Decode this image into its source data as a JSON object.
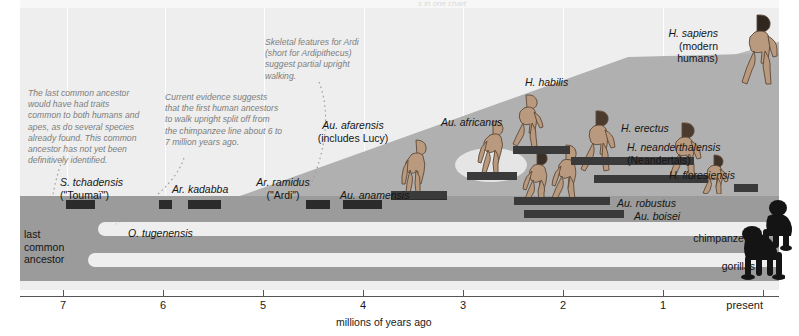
{
  "figure": {
    "title_cutoff": "s in one chart",
    "axis": {
      "title": "millions of years ago",
      "ticks": [
        {
          "label": "7",
          "value": 7,
          "x": 63
        },
        {
          "label": "6",
          "value": 6,
          "x": 163
        },
        {
          "label": "5",
          "value": 5,
          "x": 263
        },
        {
          "label": "4",
          "value": 4,
          "x": 363
        },
        {
          "label": "3",
          "value": 3,
          "x": 463
        },
        {
          "label": "2",
          "value": 2,
          "x": 563
        },
        {
          "label": "1",
          "value": 1,
          "x": 663
        },
        {
          "label": "present",
          "value": 0,
          "x": 763
        }
      ]
    },
    "root_label": "last\ncommon\nancestor",
    "notes": [
      {
        "id": "note-last-common-ancestor",
        "text": "The last common ancestor\nwould have had traits\ncommon to both humans and\napes, as do several species\nalready found. This common\nancestor has not yet been\ndefinitively identified.",
        "x": 28,
        "y": 88
      },
      {
        "id": "note-split-timing",
        "text": "Current evidence suggests\nthat the first human ancestors\nto walk upright split off from\nthe chimpanzee line about 6 to\n7 million years ago.",
        "x": 165,
        "y": 92
      },
      {
        "id": "note-ardi-skeleton",
        "text": "Skeletal features for Ardi\n(short for Ardipithecus)\nsuggest partial upright\nwalking.",
        "x": 265,
        "y": 37
      }
    ],
    "species": [
      {
        "name": "S. tchadensis",
        "alias": "(\"Toumaï\")",
        "label_x": 60,
        "label_y": 176,
        "align": "left",
        "bar_x": 66,
        "bar_w": 29,
        "bar_y": 200
      },
      {
        "name": "O. tugenensis",
        "alias": "",
        "label_x": 128,
        "label_y": 227,
        "align": "left",
        "bar_x": 159,
        "bar_w": 13,
        "bar_y": 200
      },
      {
        "name": "Ar. kadabba",
        "alias": "",
        "label_x": 172,
        "label_y": 183,
        "align": "left",
        "bar_x": 188,
        "bar_w": 33,
        "bar_y": 200
      },
      {
        "name": "Ar. ramidus",
        "alias": "(\"Ardi\")",
        "label_x": 283,
        "label_y": 176,
        "align": "center",
        "bar_x": 306,
        "bar_w": 24,
        "bar_y": 200
      },
      {
        "name": "Au. anamensis",
        "alias": "",
        "label_x": 340,
        "label_y": 189,
        "align": "left",
        "bar_x": 343,
        "bar_w": 39,
        "bar_y": 200
      },
      {
        "name": "Au. afarensis",
        "alias": "(includes Lucy)",
        "label_x": 353,
        "label_y": 119,
        "align": "center",
        "bar_x": 391,
        "bar_w": 56,
        "bar_y": 191
      },
      {
        "name": "Au. africanus",
        "alias": "",
        "label_x": 441,
        "label_y": 116,
        "align": "left",
        "bar_x": 467,
        "bar_w": 50,
        "bar_y": 172
      },
      {
        "name": "Au. robustus",
        "alias": "",
        "label_x": 617,
        "label_y": 197,
        "align": "left",
        "bar_x": 514,
        "bar_w": 96,
        "bar_y": 197
      },
      {
        "name": "Au. boisei",
        "alias": "",
        "label_x": 634,
        "label_y": 210,
        "align": "left",
        "bar_x": 524,
        "bar_w": 100,
        "bar_y": 210
      },
      {
        "name": "H. habilis",
        "alias": "",
        "label_x": 525,
        "label_y": 76,
        "align": "left",
        "bar_x": 513,
        "bar_w": 57,
        "bar_y": 146
      },
      {
        "name": "H. erectus",
        "alias": "",
        "label_x": 621,
        "label_y": 122,
        "align": "left",
        "bar_x": 571,
        "bar_w": 123,
        "bar_y": 157
      },
      {
        "name": "H. neanderthalensis",
        "alias": "(Neandertals)",
        "label_x": 627,
        "label_y": 141,
        "align": "left",
        "bar_x": 594,
        "bar_w": 114,
        "bar_y": 175
      },
      {
        "name": "H. floresiensis",
        "alias": "",
        "label_x": 669,
        "label_y": 169,
        "align": "left",
        "bar_x": 734,
        "bar_w": 24,
        "bar_y": 184
      },
      {
        "name": "H. sapiens",
        "alias": "(modern humans)",
        "label_x": 718,
        "label_y": 27,
        "align": "right",
        "bar_x": 0,
        "bar_w": 0,
        "bar_y": 0
      }
    ],
    "apes": [
      {
        "name": "chimpanzees",
        "label_x": 755,
        "label_y": 232,
        "align": "right"
      },
      {
        "name": "gorillas",
        "label_x": 755,
        "label_y": 260,
        "align": "right"
      }
    ],
    "colors": {
      "panel_bg": "#eeeeee",
      "band_gray": "#9b9b9b",
      "wedge_gray": "#b9b9b9",
      "species_bar": "#2b2b2b",
      "note_text": "#7d7d7d",
      "label_text": "#151515",
      "axis": "#555555"
    }
  }
}
